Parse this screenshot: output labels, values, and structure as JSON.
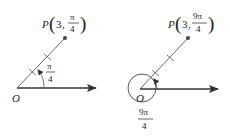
{
  "diagrams": [
    {
      "point_label": "P",
      "r": "3",
      "theta_num": "π",
      "theta_den": "4",
      "angle_num": "π",
      "angle_den": "4",
      "origin_label": "O"
    },
    {
      "point_label": "P",
      "r": "3",
      "theta_num": "9π",
      "theta_den": "4",
      "angle_num": "9π",
      "angle_den": "4",
      "origin_label": "O"
    }
  ],
  "colors": {
    "line": "#333333",
    "text": "#222222"
  }
}
